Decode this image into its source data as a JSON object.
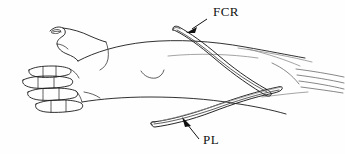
{
  "figure": {
    "background_color": "#fefefe",
    "ink_color": "#1a1a1a",
    "faint_ink_color": "#8d8d8d",
    "width": 345,
    "height": 154
  },
  "labels": [
    {
      "id": "fcr",
      "text": "FCR",
      "meaning": "flexor-carpi-radialis-tendon-graft",
      "x": 213,
      "y": 16
    },
    {
      "id": "pl",
      "text": "PL",
      "meaning": "palmaris-longus-tendon-graft",
      "x": 203,
      "y": 144
    }
  ],
  "anatomy": {
    "hand": "flexed-fingers-and-thumb",
    "forearm": "volar-forearm-outline",
    "tendons": "distal-tendon-strands"
  }
}
